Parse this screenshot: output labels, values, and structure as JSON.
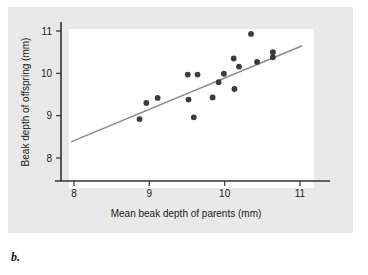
{
  "figure": {
    "caption_label": "b.",
    "panel_background": "#e9e9e9",
    "plot_background": "#ffffff"
  },
  "chart_data": {
    "type": "scatter",
    "title": "",
    "xlabel": "Mean beak depth of parents (mm)",
    "ylabel": "Beak depth of offspring (mm)",
    "xlim": [
      7.7,
      11.3
    ],
    "ylim": [
      7.7,
      11.25
    ],
    "xticks": [
      8,
      9,
      10,
      11
    ],
    "xtick_labels": [
      "8",
      "9",
      "10",
      "11"
    ],
    "yticks": [
      8,
      9,
      10,
      11
    ],
    "ytick_labels": [
      "8",
      "9",
      "10",
      "11"
    ],
    "grid": false,
    "legend": false,
    "point_color": "#3b3b3b",
    "line_color": "#8a8a8a",
    "axis_color": "#333333",
    "points": [
      {
        "x": 8.87,
        "y": 8.92
      },
      {
        "x": 8.96,
        "y": 9.3
      },
      {
        "x": 9.11,
        "y": 9.42
      },
      {
        "x": 9.51,
        "y": 9.97
      },
      {
        "x": 9.52,
        "y": 9.38
      },
      {
        "x": 9.59,
        "y": 8.96
      },
      {
        "x": 9.64,
        "y": 9.97
      },
      {
        "x": 9.84,
        "y": 9.43
      },
      {
        "x": 9.92,
        "y": 9.79
      },
      {
        "x": 9.99,
        "y": 9.99
      },
      {
        "x": 10.12,
        "y": 10.35
      },
      {
        "x": 10.13,
        "y": 9.63
      },
      {
        "x": 10.19,
        "y": 10.16
      },
      {
        "x": 10.35,
        "y": 10.93
      },
      {
        "x": 10.43,
        "y": 10.27
      },
      {
        "x": 10.64,
        "y": 10.5
      },
      {
        "x": 10.64,
        "y": 10.38
      }
    ],
    "trendline": {
      "x_start": 7.96,
      "y_start": 8.38,
      "x_end": 11.03,
      "y_end": 10.65
    }
  }
}
